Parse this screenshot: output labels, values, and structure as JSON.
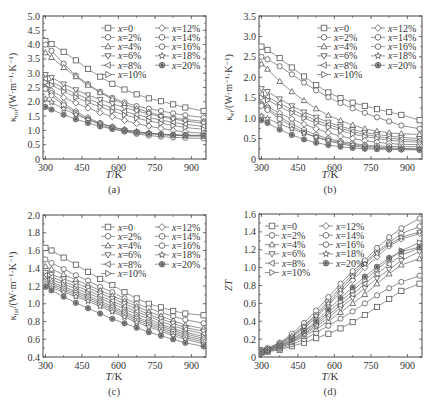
{
  "figure": {
    "x_axis_label_italic": "T",
    "x_axis_label_unit": "/K",
    "legend": [
      {
        "label": "x=0",
        "marker": "square"
      },
      {
        "label": "x=2%",
        "marker": "circle"
      },
      {
        "label": "x=4%",
        "marker": "triangle-up"
      },
      {
        "label": "x=6%",
        "marker": "triangle-down"
      },
      {
        "label": "x=8%",
        "marker": "triangle-left"
      },
      {
        "label": "x=10%",
        "marker": "triangle-right"
      },
      {
        "label": "x=12%",
        "marker": "diamond"
      },
      {
        "label": "x=14%",
        "marker": "hexagon"
      },
      {
        "label": "x=16%",
        "marker": "circle"
      },
      {
        "label": "x=18%",
        "marker": "star"
      },
      {
        "label": "x=20%",
        "marker": "circle-filled"
      }
    ],
    "colors": {
      "line": "#666666",
      "marker_stroke": "#555555",
      "axis": "#444444",
      "filled_marker": "#777777"
    }
  },
  "chart_data": [
    {
      "id": "a",
      "type": "line",
      "caption": "(a)",
      "title": "",
      "xlabel": "T/K",
      "ylabel": "κtot/(W·m⁻¹·K⁻¹)",
      "ylabel_main": "κ",
      "ylabel_sub": "tot",
      "ylabel_rest": "/(W·m⁻¹·K⁻¹)",
      "xlim": [
        290,
        960
      ],
      "ylim": [
        0,
        5.0
      ],
      "xticks": [
        300,
        450,
        600,
        750,
        900
      ],
      "yticks": [
        0,
        0.5,
        1.0,
        1.5,
        2.0,
        2.5,
        3.0,
        3.5,
        4.0,
        4.5,
        5.0
      ],
      "ytick_labels": [
        "0",
        "0.5",
        "1.0",
        "1.5",
        "2.0",
        "2.5",
        "3.0",
        "3.5",
        "4.0",
        "4.5",
        "5.0"
      ],
      "grid": false,
      "legend_position": "upper right",
      "x": [
        300,
        325,
        375,
        425,
        475,
        525,
        575,
        625,
        675,
        725,
        775,
        825,
        875,
        950
      ],
      "series": [
        {
          "name": "x=0",
          "values": [
            4.12,
            4.02,
            3.75,
            3.45,
            3.15,
            2.88,
            2.63,
            2.43,
            2.26,
            2.12,
            2.02,
            1.91,
            1.8,
            1.68
          ]
        },
        {
          "name": "x=2%",
          "values": [
            4.0,
            3.78,
            3.33,
            2.92,
            2.62,
            2.35,
            2.14,
            1.98,
            1.85,
            1.76,
            1.68,
            1.6,
            1.53,
            1.45
          ]
        },
        {
          "name": "x=4%",
          "values": [
            3.72,
            3.55,
            3.2,
            2.88,
            2.58,
            2.32,
            2.1,
            1.92,
            1.76,
            1.64,
            1.52,
            1.44,
            1.38,
            1.32
          ]
        },
        {
          "name": "x=6%",
          "values": [
            2.95,
            2.85,
            2.62,
            2.42,
            2.24,
            2.08,
            1.93,
            1.8,
            1.68,
            1.58,
            1.48,
            1.4,
            1.33,
            1.25
          ]
        },
        {
          "name": "x=8%",
          "values": [
            2.8,
            2.7,
            2.48,
            2.28,
            2.1,
            1.94,
            1.79,
            1.66,
            1.55,
            1.45,
            1.36,
            1.28,
            1.21,
            1.14
          ]
        },
        {
          "name": "x=10%",
          "values": [
            2.68,
            2.58,
            2.36,
            2.16,
            1.98,
            1.82,
            1.67,
            1.54,
            1.43,
            1.33,
            1.25,
            1.17,
            1.1,
            1.04
          ]
        },
        {
          "name": "x=12%",
          "values": [
            2.5,
            2.38,
            2.15,
            1.96,
            1.78,
            1.62,
            1.48,
            1.35,
            1.24,
            1.15,
            1.07,
            1.0,
            0.95,
            0.9
          ]
        },
        {
          "name": "x=14%",
          "values": [
            2.48,
            2.3,
            1.95,
            1.66,
            1.44,
            1.26,
            1.12,
            1.02,
            0.95,
            0.9,
            0.87,
            0.85,
            0.84,
            0.83
          ]
        },
        {
          "name": "x=16%",
          "values": [
            2.45,
            2.22,
            1.88,
            1.6,
            1.38,
            1.2,
            1.06,
            0.96,
            0.88,
            0.82,
            0.78,
            0.76,
            0.74,
            0.72
          ]
        },
        {
          "name": "x=18%",
          "values": [
            2.1,
            1.98,
            1.75,
            1.55,
            1.38,
            1.24,
            1.12,
            1.02,
            0.95,
            0.9,
            0.86,
            0.83,
            0.81,
            0.8
          ]
        },
        {
          "name": "x=20%",
          "values": [
            1.82,
            1.73,
            1.55,
            1.39,
            1.26,
            1.14,
            1.05,
            0.98,
            0.92,
            0.88,
            0.85,
            0.83,
            0.82,
            0.81
          ]
        }
      ]
    },
    {
      "id": "b",
      "type": "line",
      "caption": "(b)",
      "title": "",
      "xlabel": "T/K",
      "ylabel": "κel/(W·m⁻¹·K⁻¹)",
      "ylabel_main": "κ",
      "ylabel_sub": "el",
      "ylabel_rest": "/(W·m⁻¹·K⁻¹)",
      "xlim": [
        290,
        960
      ],
      "ylim": [
        0,
        3.5
      ],
      "xticks": [
        300,
        450,
        600,
        750,
        900
      ],
      "yticks": [
        0,
        0.5,
        1.0,
        1.5,
        2.0,
        2.5,
        3.0,
        3.5
      ],
      "ytick_labels": [
        "0",
        "0.5",
        "1.0",
        "1.5",
        "2.0",
        "2.5",
        "3.0",
        "3.5"
      ],
      "grid": false,
      "legend_position": "upper right",
      "x": [
        300,
        325,
        375,
        425,
        475,
        525,
        575,
        625,
        675,
        725,
        775,
        825,
        875,
        950
      ],
      "series": [
        {
          "name": "x=0",
          "values": [
            2.75,
            2.67,
            2.47,
            2.24,
            2.02,
            1.81,
            1.63,
            1.49,
            1.38,
            1.3,
            1.22,
            1.15,
            1.08,
            0.95
          ]
        },
        {
          "name": "x=2%",
          "values": [
            2.5,
            2.44,
            2.27,
            2.07,
            1.87,
            1.68,
            1.51,
            1.37,
            1.24,
            1.13,
            1.02,
            0.92,
            0.82,
            0.74
          ]
        },
        {
          "name": "x=4%",
          "values": [
            2.33,
            2.2,
            1.9,
            1.65,
            1.43,
            1.23,
            1.07,
            0.94,
            0.83,
            0.74,
            0.68,
            0.64,
            0.62,
            0.6
          ]
        },
        {
          "name": "x=6%",
          "values": [
            1.72,
            1.65,
            1.47,
            1.3,
            1.15,
            1.02,
            0.9,
            0.8,
            0.72,
            0.65,
            0.6,
            0.56,
            0.53,
            0.5
          ]
        },
        {
          "name": "x=8%",
          "values": [
            1.58,
            1.52,
            1.36,
            1.21,
            1.07,
            0.95,
            0.84,
            0.75,
            0.67,
            0.6,
            0.55,
            0.51,
            0.48,
            0.45
          ]
        },
        {
          "name": "x=10%",
          "values": [
            1.5,
            1.44,
            1.28,
            1.13,
            1.0,
            0.88,
            0.78,
            0.69,
            0.61,
            0.55,
            0.5,
            0.46,
            0.43,
            0.41
          ]
        },
        {
          "name": "x=12%",
          "values": [
            1.35,
            1.28,
            1.12,
            0.98,
            0.85,
            0.74,
            0.64,
            0.56,
            0.5,
            0.45,
            0.41,
            0.38,
            0.36,
            0.35
          ]
        },
        {
          "name": "x=14%",
          "values": [
            1.33,
            1.24,
            1.03,
            0.86,
            0.71,
            0.59,
            0.5,
            0.43,
            0.38,
            0.34,
            0.32,
            0.31,
            0.3,
            0.3
          ]
        },
        {
          "name": "x=16%",
          "values": [
            1.3,
            1.2,
            0.98,
            0.8,
            0.65,
            0.53,
            0.44,
            0.37,
            0.32,
            0.28,
            0.26,
            0.25,
            0.24,
            0.24
          ]
        },
        {
          "name": "x=18%",
          "values": [
            1.05,
            0.99,
            0.86,
            0.74,
            0.63,
            0.54,
            0.46,
            0.4,
            0.35,
            0.31,
            0.29,
            0.27,
            0.26,
            0.25
          ]
        },
        {
          "name": "x=20%",
          "values": [
            0.95,
            0.88,
            0.72,
            0.59,
            0.48,
            0.4,
            0.34,
            0.3,
            0.27,
            0.25,
            0.24,
            0.23,
            0.23,
            0.22
          ]
        }
      ]
    },
    {
      "id": "c",
      "type": "line",
      "caption": "(c)",
      "title": "",
      "xlabel": "T/K",
      "ylabel": "κlat/(W·m⁻¹·K⁻¹)",
      "ylabel_main": "κ",
      "ylabel_sub": "lat",
      "ylabel_rest": "/(W·m⁻¹·K⁻¹)",
      "xlim": [
        290,
        960
      ],
      "ylim": [
        0.4,
        2.0
      ],
      "xticks": [
        300,
        450,
        600,
        750,
        900
      ],
      "yticks": [
        0.4,
        0.6,
        0.8,
        1.0,
        1.2,
        1.4,
        1.6,
        1.8,
        2.0
      ],
      "ytick_labels": [
        "0.4",
        "0.6",
        "0.8",
        "1.0",
        "1.2",
        "1.4",
        "1.6",
        "1.8",
        "2.0"
      ],
      "grid": false,
      "legend_position": "upper right",
      "x": [
        300,
        325,
        375,
        425,
        475,
        525,
        575,
        625,
        675,
        725,
        775,
        825,
        875,
        950
      ],
      "series": [
        {
          "name": "x=0",
          "values": [
            1.63,
            1.6,
            1.52,
            1.44,
            1.36,
            1.28,
            1.21,
            1.13,
            1.06,
            1.0,
            0.96,
            0.92,
            0.89,
            0.87
          ]
        },
        {
          "name": "x=2%",
          "values": [
            1.5,
            1.46,
            1.39,
            1.32,
            1.26,
            1.19,
            1.13,
            1.06,
            1.0,
            0.95,
            0.9,
            0.86,
            0.82,
            0.78
          ]
        },
        {
          "name": "x=4%",
          "values": [
            1.42,
            1.39,
            1.33,
            1.27,
            1.21,
            1.15,
            1.09,
            1.03,
            0.97,
            0.91,
            0.86,
            0.81,
            0.76,
            0.72
          ]
        },
        {
          "name": "x=6%",
          "values": [
            1.35,
            1.33,
            1.28,
            1.23,
            1.18,
            1.12,
            1.06,
            1.0,
            0.94,
            0.88,
            0.83,
            0.78,
            0.73,
            0.69
          ]
        },
        {
          "name": "x=8%",
          "values": [
            1.32,
            1.3,
            1.25,
            1.2,
            1.15,
            1.09,
            1.03,
            0.97,
            0.91,
            0.86,
            0.8,
            0.75,
            0.71,
            0.66
          ]
        },
        {
          "name": "x=10%",
          "values": [
            1.29,
            1.27,
            1.22,
            1.17,
            1.12,
            1.06,
            1.0,
            0.94,
            0.88,
            0.83,
            0.77,
            0.72,
            0.68,
            0.63
          ]
        },
        {
          "name": "x=12%",
          "values": [
            1.26,
            1.24,
            1.19,
            1.14,
            1.09,
            1.03,
            0.97,
            0.91,
            0.85,
            0.8,
            0.75,
            0.7,
            0.66,
            0.61
          ]
        },
        {
          "name": "x=14%",
          "values": [
            1.24,
            1.22,
            1.17,
            1.12,
            1.07,
            1.01,
            0.95,
            0.89,
            0.83,
            0.78,
            0.73,
            0.68,
            0.64,
            0.59
          ]
        },
        {
          "name": "x=16%",
          "values": [
            1.22,
            1.2,
            1.15,
            1.1,
            1.05,
            0.99,
            0.93,
            0.87,
            0.81,
            0.76,
            0.71,
            0.66,
            0.62,
            0.57
          ]
        },
        {
          "name": "x=18%",
          "values": [
            1.2,
            1.18,
            1.13,
            1.08,
            1.03,
            0.97,
            0.91,
            0.85,
            0.79,
            0.74,
            0.69,
            0.64,
            0.6,
            0.55
          ]
        },
        {
          "name": "x=20%",
          "values": [
            1.19,
            1.15,
            1.08,
            1.01,
            0.95,
            0.89,
            0.83,
            0.78,
            0.73,
            0.68,
            0.64,
            0.6,
            0.56,
            0.52
          ]
        }
      ]
    },
    {
      "id": "d",
      "type": "line",
      "caption": "(d)",
      "title": "",
      "xlabel": "T/K",
      "ylabel": "ZT",
      "ylabel_main": "ZT",
      "ylabel_sub": "",
      "ylabel_rest": "",
      "xlim": [
        290,
        960
      ],
      "ylim": [
        0,
        1.6
      ],
      "xticks": [
        300,
        450,
        600,
        750,
        900
      ],
      "yticks": [
        0,
        0.2,
        0.4,
        0.6,
        0.8,
        1.0,
        1.2,
        1.4,
        1.6
      ],
      "ytick_labels": [
        "0",
        "0.2",
        "0.4",
        "0.6",
        "0.8",
        "1.0",
        "1.2",
        "1.4",
        "1.6"
      ],
      "grid": false,
      "legend_position": "upper left",
      "x": [
        300,
        325,
        375,
        425,
        475,
        525,
        575,
        625,
        675,
        725,
        775,
        825,
        875,
        950
      ],
      "series": [
        {
          "name": "x=0",
          "values": [
            0.05,
            0.06,
            0.08,
            0.12,
            0.16,
            0.21,
            0.26,
            0.32,
            0.39,
            0.47,
            0.56,
            0.65,
            0.74,
            0.82
          ]
        },
        {
          "name": "x=2%",
          "values": [
            0.05,
            0.06,
            0.09,
            0.14,
            0.2,
            0.27,
            0.35,
            0.43,
            0.51,
            0.6,
            0.69,
            0.77,
            0.84,
            0.91
          ]
        },
        {
          "name": "x=4%",
          "values": [
            0.06,
            0.07,
            0.1,
            0.16,
            0.23,
            0.31,
            0.4,
            0.5,
            0.6,
            0.7,
            0.82,
            0.93,
            1.03,
            1.1
          ]
        },
        {
          "name": "x=6%",
          "values": [
            0.06,
            0.07,
            0.11,
            0.17,
            0.25,
            0.34,
            0.44,
            0.55,
            0.66,
            0.77,
            0.88,
            0.98,
            1.08,
            1.18
          ]
        },
        {
          "name": "x=8%",
          "values": [
            0.06,
            0.08,
            0.12,
            0.18,
            0.26,
            0.36,
            0.47,
            0.58,
            0.7,
            0.82,
            0.93,
            1.04,
            1.14,
            1.22
          ]
        },
        {
          "name": "x=10%",
          "values": [
            0.07,
            0.08,
            0.12,
            0.19,
            0.28,
            0.38,
            0.5,
            0.62,
            0.74,
            0.86,
            0.98,
            1.09,
            1.19,
            1.28
          ]
        },
        {
          "name": "x=12%",
          "values": [
            0.07,
            0.09,
            0.14,
            0.22,
            0.32,
            0.44,
            0.58,
            0.72,
            0.86,
            1.0,
            1.12,
            1.24,
            1.32,
            1.38
          ]
        },
        {
          "name": "x=14%",
          "values": [
            0.07,
            0.09,
            0.15,
            0.24,
            0.35,
            0.48,
            0.63,
            0.78,
            0.93,
            1.06,
            1.18,
            1.28,
            1.38,
            1.46
          ]
        },
        {
          "name": "x=16%",
          "values": [
            0.08,
            0.1,
            0.16,
            0.26,
            0.38,
            0.52,
            0.67,
            0.82,
            0.96,
            1.08,
            1.22,
            1.34,
            1.44,
            1.55
          ]
        },
        {
          "name": "x=18%",
          "values": [
            0.07,
            0.09,
            0.15,
            0.23,
            0.34,
            0.46,
            0.6,
            0.75,
            0.9,
            1.04,
            1.16,
            1.26,
            1.34,
            1.4
          ]
        },
        {
          "name": "x=20%",
          "values": [
            0.06,
            0.08,
            0.13,
            0.2,
            0.29,
            0.4,
            0.53,
            0.66,
            0.78,
            0.9,
            1.01,
            1.11,
            1.18,
            1.23
          ]
        }
      ]
    }
  ]
}
